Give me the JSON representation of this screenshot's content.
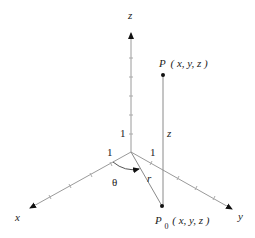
{
  "diagram": {
    "axes": {
      "x": {
        "label": "x"
      },
      "y": {
        "label": "y"
      },
      "z": {
        "label": "z"
      }
    },
    "unit_labels": {
      "x_unit": "1",
      "y_unit": "1",
      "z_unit": "1"
    },
    "points": {
      "P": {
        "name": "P",
        "coords": "( x, y, z )"
      },
      "P0": {
        "name": "P",
        "subscript": "0",
        "coords": "( x, y, z )"
      }
    },
    "segment_labels": {
      "height": "z",
      "radius": "r",
      "angle": "θ"
    },
    "colors": {
      "axis": "#9a9a9a",
      "segment": "#8a8a8a",
      "text": "#222222",
      "point": "#111111"
    }
  }
}
